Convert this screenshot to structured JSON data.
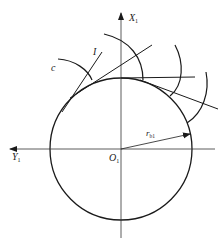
{
  "diagram": {
    "type": "involute-gear-generation",
    "labels": {
      "x_axis": "X",
      "x_axis_sub": "1",
      "y_axis": "Y",
      "y_axis_sub": "1",
      "origin": "O",
      "origin_sub": "1",
      "radius": "r",
      "radius_sub": "b1",
      "curve_c": "c",
      "line_I": "I"
    },
    "colors": {
      "stroke": "#1a1a1a",
      "axis": "#333333",
      "background": "#ffffff"
    }
  }
}
